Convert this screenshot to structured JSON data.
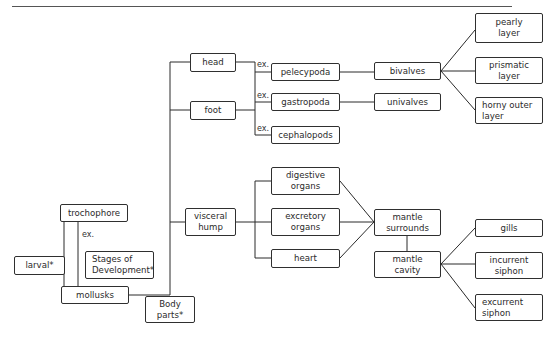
{
  "diagram": {
    "type": "concept-map",
    "root": "mollusks",
    "nodes": {
      "head": "head",
      "foot": "foot",
      "visceral_hump": "visceral\nhump",
      "pelecypoda": "pelecypoda",
      "gastropoda": "gastropoda",
      "cephalopods": "cephalopods",
      "bivalves": "bivalves",
      "univalves": "univalves",
      "pearly_layer": "pearly\nlayer",
      "prismatic_layer": "prismatic\nlayer",
      "horny_outer_layer": "horny outer\nlayer",
      "digestive_organs": "digestive\norgans",
      "excretory_organs": "excretory\norgans",
      "heart": "heart",
      "mantle_surrounds": "mantle\nsurrounds",
      "mantle_cavity": "mantle\ncavity",
      "gills": "gills",
      "incurrent_siphon": "incurrent\nsiphon",
      "excurrent_siphon": "excurrent\nsiphon",
      "trochophore": "trochophore",
      "larval": "larval*",
      "stages_of_development": "Stages of\nDevelopment*",
      "mollusks": "mollusks",
      "body_parts": "Body\nparts*"
    },
    "link_labels": {
      "ex_pelecypoda": "ex.",
      "ex_gastropoda": "ex.",
      "ex_cephalopods": "ex.",
      "ex_trochophore": "ex."
    },
    "edges": [
      [
        "mollusks",
        "head"
      ],
      [
        "mollusks",
        "foot"
      ],
      [
        "mollusks",
        "visceral_hump"
      ],
      [
        "head",
        "pelecypoda"
      ],
      [
        "foot",
        "gastropoda"
      ],
      [
        "foot",
        "cephalopods"
      ],
      [
        "pelecypoda",
        "bivalves"
      ],
      [
        "gastropoda",
        "univalves"
      ],
      [
        "bivalves",
        "pearly_layer"
      ],
      [
        "bivalves",
        "prismatic_layer"
      ],
      [
        "bivalves",
        "horny_outer_layer"
      ],
      [
        "visceral_hump",
        "digestive_organs"
      ],
      [
        "visceral_hump",
        "excretory_organs"
      ],
      [
        "visceral_hump",
        "heart"
      ],
      [
        "digestive_organs",
        "mantle_surrounds"
      ],
      [
        "excretory_organs",
        "mantle_surrounds"
      ],
      [
        "heart",
        "mantle_surrounds"
      ],
      [
        "mantle_surrounds",
        "mantle_cavity"
      ],
      [
        "mantle_cavity",
        "gills"
      ],
      [
        "mantle_cavity",
        "incurrent_siphon"
      ],
      [
        "mantle_cavity",
        "excurrent_siphon"
      ],
      [
        "larval",
        "trochophore"
      ],
      [
        "mollusks",
        "trochophore"
      ]
    ]
  }
}
